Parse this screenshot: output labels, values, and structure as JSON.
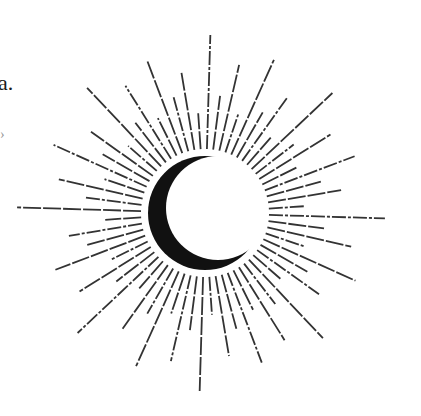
{
  "text_fragments": {
    "top_left": "a.",
    "left_mark": "›"
  },
  "illustration": {
    "name": "crescent-moon-sunburst",
    "center": [
      205,
      213
    ],
    "moon": {
      "outer_radius": 57,
      "inner_offset": [
        13,
        -5
      ],
      "inner_radius": 52,
      "color": "#111111"
    },
    "rays": {
      "count": 64,
      "inner_radius": 64,
      "color": "#333333",
      "lengths": [
        180,
        120,
        150,
        105,
        165,
        118,
        140,
        100,
        172,
        115,
        150,
        108,
        160,
        120,
        145,
        102,
        178,
        118,
        152,
        106,
        168,
        116,
        142,
        100,
        175,
        112,
        148,
        104,
        160,
        122,
        138,
        100,
        188,
        120,
        150,
        106,
        166,
        118,
        140,
        102,
        172,
        114,
        150,
        106,
        162,
        120,
        144,
        100,
        178,
        118,
        152,
        104,
        168,
        116,
        142,
        100,
        175,
        112,
        148,
        104,
        160,
        120,
        138,
        100
      ]
    }
  }
}
